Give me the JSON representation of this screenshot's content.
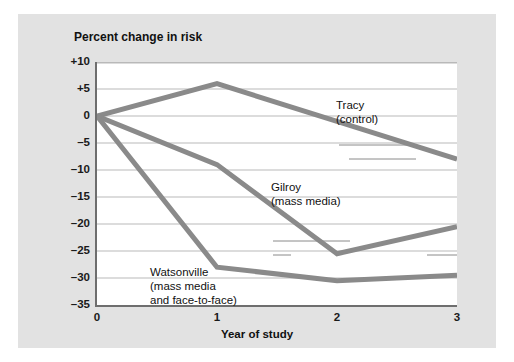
{
  "figure": {
    "y_axis_title": "Percent change in risk",
    "x_axis_title": "Year of study"
  },
  "axes": {
    "y_ticks": [
      "+10",
      "+5",
      "0",
      "–5",
      "–10",
      "–15",
      "–20",
      "–25",
      "–30",
      "–35"
    ],
    "y_tick_values": [
      10,
      5,
      0,
      -5,
      -10,
      -15,
      -20,
      -25,
      -30,
      -35
    ],
    "x_ticks": [
      "0",
      "1",
      "2",
      "3"
    ],
    "x_tick_values": [
      0,
      1,
      2,
      3
    ]
  },
  "annotations": {
    "tracy": {
      "line1": "Tracy",
      "line2": "(control)"
    },
    "gilroy": {
      "line1": "Gilroy",
      "line2": "(mass media)"
    },
    "watsonville": {
      "line1": "Watsonville",
      "line2": "(mass media",
      "line3": "and face-to-face)"
    }
  },
  "colors": {
    "panel_background": "#e2e2e2",
    "plot_background": "#ffffff",
    "axis": "#6e6e6e",
    "gridline": "#b9b9b9",
    "series_line": "#8a8a8a",
    "leader_line": "#8a8a8a",
    "text": "#111111"
  },
  "chart_data": {
    "type": "line",
    "title": "",
    "xlabel": "Year of study",
    "ylabel": "Percent change in risk",
    "x": [
      0,
      1,
      2,
      3
    ],
    "xlim": [
      0,
      3
    ],
    "ylim": [
      -35,
      10
    ],
    "grid": true,
    "legend": "inline-annotations",
    "series": [
      {
        "name": "Tracy (control)",
        "values": [
          0,
          6,
          -1,
          -8
        ]
      },
      {
        "name": "Gilroy (mass media)",
        "values": [
          0,
          -9,
          -25.5,
          -20.5
        ]
      },
      {
        "name": "Watsonville (mass media and face-to-face)",
        "values": [
          0,
          -28,
          -30.5,
          -29.5
        ]
      }
    ]
  }
}
